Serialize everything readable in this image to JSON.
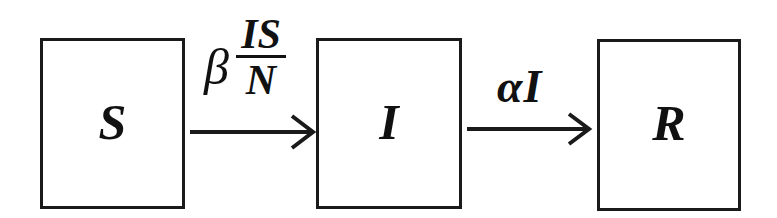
{
  "diagram": {
    "compartments": [
      {
        "id": "S",
        "label": "S",
        "meaning": "Susceptible"
      },
      {
        "id": "I",
        "label": "I",
        "meaning": "Infected"
      },
      {
        "id": "R",
        "label": "R",
        "meaning": "Recovered"
      }
    ],
    "transitions": [
      {
        "from": "S",
        "to": "I",
        "rate": {
          "coefficient": "β",
          "numerator": "IS",
          "denominator": "N"
        }
      },
      {
        "from": "I",
        "to": "R",
        "rate": {
          "coefficient": "α",
          "variable": "I",
          "text": "αI"
        }
      }
    ],
    "colors": {
      "stroke": "#1a1a1a",
      "background": "#ffffff",
      "text": "#111111"
    }
  }
}
